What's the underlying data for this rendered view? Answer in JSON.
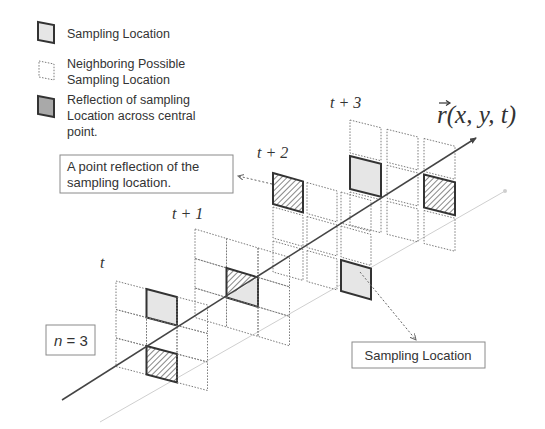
{
  "legend": {
    "items": [
      {
        "icon": "sampling-cell-icon",
        "lines": [
          "Sampling Location"
        ]
      },
      {
        "icon": "neighbor-cell-icon",
        "lines": [
          "Neighboring Possible",
          "Sampling Location"
        ]
      },
      {
        "icon": "reflection-cell-icon",
        "lines": [
          "Reflection of sampling",
          "Location across central",
          "point."
        ]
      }
    ]
  },
  "callouts": {
    "reflection": {
      "lines": [
        "A point reflection of the",
        "sampling location."
      ]
    },
    "sampling": {
      "text": "Sampling Location"
    },
    "n_box": {
      "var": "n",
      "eq": " = 3"
    }
  },
  "axis": {
    "vector": "r",
    "args": "(x, y, t)"
  },
  "grids": [
    {
      "label": "t",
      "cells": [
        [
          "neighbor",
          "sampling",
          "neighbor"
        ],
        [
          "neighbor",
          "neighbor",
          "neighbor"
        ],
        [
          "neighbor",
          "reflection",
          "neighbor"
        ]
      ]
    },
    {
      "label": "t + 1",
      "cells": [
        [
          "neighbor",
          "neighbor",
          "neighbor"
        ],
        [
          "neighbor",
          "center",
          "neighbor"
        ],
        [
          "neighbor",
          "neighbor",
          "neighbor"
        ]
      ]
    },
    {
      "label": "t + 2",
      "cells": [
        [
          "reflection",
          "neighbor",
          "neighbor"
        ],
        [
          "neighbor",
          "neighbor",
          "neighbor"
        ],
        [
          "neighbor",
          "neighbor",
          "sampling"
        ]
      ]
    },
    {
      "label": "t + 3",
      "cells": [
        [
          "neighbor",
          "neighbor",
          "neighbor"
        ],
        [
          "sampling",
          "neighbor",
          "reflection"
        ],
        [
          "neighbor",
          "neighbor",
          "neighbor"
        ]
      ]
    }
  ],
  "colors": {
    "sampling_fill": "#e6e6e6",
    "reflection_fill": "#a9a9a9",
    "bold_stroke": "#333333",
    "dotted_stroke": "#7a7a7a",
    "axis": "#444444",
    "faint_axis": "#cfcfcf"
  }
}
